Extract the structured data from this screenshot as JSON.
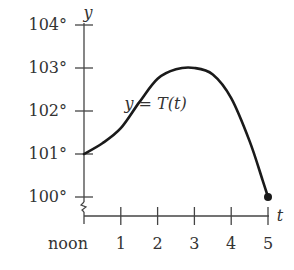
{
  "chart_data": {
    "type": "line",
    "title": "",
    "xlabel": "t",
    "ylabel": "y",
    "curve_label": "y = T(t)",
    "x_ticks": [
      0,
      1,
      2,
      3,
      4,
      5
    ],
    "x_tick_labels": [
      "noon",
      "1",
      "2",
      "3",
      "4",
      "5"
    ],
    "y_ticks": [
      100,
      101,
      102,
      103,
      104
    ],
    "y_tick_labels": [
      "100°",
      "101°",
      "102°",
      "103°",
      "104°"
    ],
    "xlim": [
      0,
      5
    ],
    "ylim": [
      100,
      104
    ],
    "axis_break_on_y": true,
    "endpoint_marker": {
      "x": 5,
      "y": 100
    },
    "points": [
      {
        "x": 0,
        "y": 101
      },
      {
        "x": 0.5,
        "y": 101.25
      },
      {
        "x": 1,
        "y": 101.6
      },
      {
        "x": 1.5,
        "y": 102.2
      },
      {
        "x": 2,
        "y": 102.75
      },
      {
        "x": 2.5,
        "y": 102.97
      },
      {
        "x": 3,
        "y": 103
      },
      {
        "x": 3.5,
        "y": 102.85
      },
      {
        "x": 4,
        "y": 102.3
      },
      {
        "x": 4.5,
        "y": 101.3
      },
      {
        "x": 4.85,
        "y": 100.4
      },
      {
        "x": 5,
        "y": 100
      }
    ],
    "grid": false
  },
  "colors": {
    "curve": "#1a1a1a",
    "axis": "#444444",
    "text": "#333333"
  }
}
